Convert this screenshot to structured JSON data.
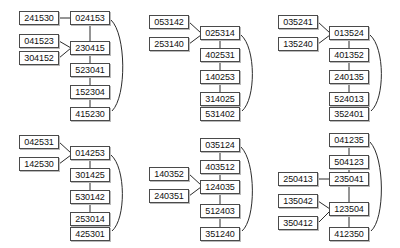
{
  "diagram": {
    "node_style": {
      "border_color": "#4a4a4a",
      "fill_color": "#ffffff",
      "text_color": "#111111",
      "shadow_color": "#b9b9b9"
    },
    "edge_color": "#2b2b2b",
    "groups": [
      {
        "id": "group-1",
        "chain": [
          "024153",
          "230415",
          "523041",
          "152304",
          "415230"
        ],
        "inputs": [
          {
            "label": "241530",
            "target": "024153"
          },
          {
            "label": "041523",
            "target": "230415"
          },
          {
            "label": "304152",
            "target": "230415"
          }
        ],
        "feedback": {
          "from": "024153",
          "to": "415230"
        }
      },
      {
        "id": "group-2",
        "chain": [
          "025314",
          "402531",
          "140253",
          "314025",
          "531402"
        ],
        "inputs": [
          {
            "label": "053142",
            "target": "025314"
          },
          {
            "label": "253140",
            "target": "025314"
          }
        ],
        "feedback": {
          "from": "025314",
          "to": "531402"
        }
      },
      {
        "id": "group-3",
        "chain": [
          "013524",
          "401352",
          "240135",
          "524013",
          "352401"
        ],
        "inputs": [
          {
            "label": "035241",
            "target": "013524"
          },
          {
            "label": "135240",
            "target": "013524"
          }
        ],
        "feedback": {
          "from": "013524",
          "to": "352401"
        }
      },
      {
        "id": "group-4",
        "chain": [
          "014253",
          "301425",
          "530142",
          "253014",
          "425301"
        ],
        "inputs": [
          {
            "label": "042531",
            "target": "014253"
          },
          {
            "label": "142530",
            "target": "014253"
          }
        ],
        "feedback": {
          "from": "014253",
          "to": "425301"
        }
      },
      {
        "id": "group-5",
        "chain": [
          "035124",
          "403512",
          "124035",
          "512403",
          "351240"
        ],
        "inputs": [
          {
            "label": "140352",
            "target": "124035"
          },
          {
            "label": "240351",
            "target": "124035"
          }
        ],
        "feedback": {
          "from": "035124",
          "to": "351240"
        }
      },
      {
        "id": "group-6",
        "chain": [
          "041235",
          "504123",
          "235041",
          "123504",
          "412350"
        ],
        "inputs": [
          {
            "label": "250413",
            "target": "235041"
          },
          {
            "label": "135042",
            "target": "123504"
          },
          {
            "label": "350412",
            "target": "123504"
          }
        ],
        "feedback": {
          "from": "041235",
          "to": "412350"
        }
      }
    ]
  },
  "nodes": {
    "g1c0": "024153",
    "g1c1": "230415",
    "g1c2": "523041",
    "g1c3": "152304",
    "g1c4": "415230",
    "g1i0": "241530",
    "g1i1": "041523",
    "g1i2": "304152",
    "g2c0": "025314",
    "g2c1": "402531",
    "g2c2": "140253",
    "g2c3": "314025",
    "g2c4": "531402",
    "g2i0": "053142",
    "g2i1": "253140",
    "g3c0": "013524",
    "g3c1": "401352",
    "g3c2": "240135",
    "g3c3": "524013",
    "g3c4": "352401",
    "g3i0": "035241",
    "g3i1": "135240",
    "g4c0": "014253",
    "g4c1": "301425",
    "g4c2": "530142",
    "g4c3": "253014",
    "g4c4": "425301",
    "g4i0": "042531",
    "g4i1": "142530",
    "g5c0": "035124",
    "g5c1": "403512",
    "g5c2": "124035",
    "g5c3": "512403",
    "g5c4": "351240",
    "g5i0": "140352",
    "g5i1": "240351",
    "g6c0": "041235",
    "g6c1": "504123",
    "g6c2": "235041",
    "g6c3": "123504",
    "g6c4": "412350",
    "g6i0": "250413",
    "g6i1": "135042",
    "g6i2": "350412"
  }
}
